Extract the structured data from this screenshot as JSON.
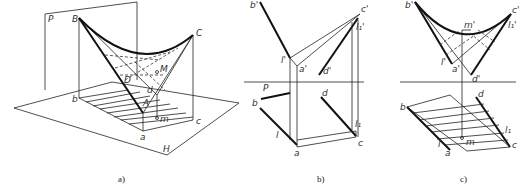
{
  "figure": {
    "panels": [
      {
        "id": "a",
        "caption": "a)",
        "labels": {
          "P": "P",
          "B": "B",
          "C": "C",
          "D": "D",
          "M": "M",
          "A": "A",
          "b": "b",
          "a": "a",
          "c": "c",
          "d": "d",
          "m": "m",
          "H": "H"
        }
      },
      {
        "id": "b",
        "caption": "b)",
        "labels": {
          "b_prime": "b'",
          "c_prime": "c'",
          "l1_prime": "l₁'",
          "l_prime": "l'",
          "a_prime": "a'",
          "d_prime": "d'",
          "PH": "P",
          "PH_sub": "H",
          "b": "b",
          "d": "d",
          "l1": "l₁",
          "l": "l",
          "a": "a",
          "c": "c"
        }
      },
      {
        "id": "c",
        "caption": "c)",
        "labels": {
          "b_prime": "b'",
          "c_prime": "c'",
          "m_prime": "m'",
          "l1_prime": "l₁'",
          "l_prime": "l'",
          "a_prime": "a'",
          "d_prime": "d'",
          "b": "b",
          "d": "d",
          "l1": "l₁",
          "l": "l",
          "a": "a",
          "m": "m",
          "c": "c"
        }
      }
    ]
  }
}
